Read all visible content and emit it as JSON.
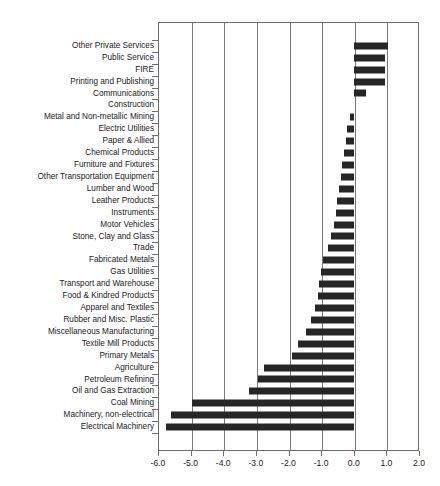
{
  "chart_data": {
    "type": "bar",
    "orientation": "horizontal",
    "title": "",
    "xlabel": "",
    "ylabel": "",
    "xlim": [
      -6.0,
      2.0
    ],
    "xticks": [
      "-6.0",
      "-5.0",
      "-4.0",
      "-3.0",
      "-2.0",
      "-1.0",
      "0.0",
      "1.0",
      "2.0"
    ],
    "xtick_values": [
      -6.0,
      -5.0,
      -4.0,
      -3.0,
      -2.0,
      -1.0,
      0.0,
      1.0,
      2.0
    ],
    "grid": "vertical",
    "legend": "none",
    "bar_color": "#262626",
    "categories": [
      "Other Private Services",
      "Public Service",
      "FIRE",
      "Printing and Publishing",
      "Communications",
      "Construction",
      "Metal and Non-metallic Mining",
      "Electric Utilities",
      "Paper & Allied",
      "Chemical Products",
      "Furniture and Fixtures",
      "Other Transportation Equipment",
      "Lumber and Wood",
      "Leather Products",
      "Instruments",
      "Motor Vehicles",
      "Stone, Clay and Glass",
      "Trade",
      "Fabricated Metals",
      "Gas Utilities",
      "Transport and Warehouse",
      "Food & Kindred Products",
      "Apparel and Textiles",
      "Rubber and Misc. Plastic",
      "Miscellaneous Manufacturing",
      "Textile Mill Products",
      "Primary Metals",
      "Agriculture",
      "Petroleum Refining",
      "Oil and Gas Extraction",
      "Coal Mining",
      "Machinery, non-electrical",
      "Electrical Machinery"
    ],
    "values": [
      1.05,
      0.95,
      0.95,
      0.97,
      0.38,
      0.0,
      -0.1,
      -0.2,
      -0.25,
      -0.3,
      -0.35,
      -0.4,
      -0.45,
      -0.5,
      -0.55,
      -0.6,
      -0.7,
      -0.8,
      -0.95,
      -1.0,
      -1.05,
      -1.1,
      -1.2,
      -1.3,
      -1.45,
      -1.7,
      -1.9,
      -2.75,
      -2.95,
      -3.2,
      -4.95,
      -5.6,
      -5.75
    ]
  },
  "caption": {
    "text": ""
  }
}
